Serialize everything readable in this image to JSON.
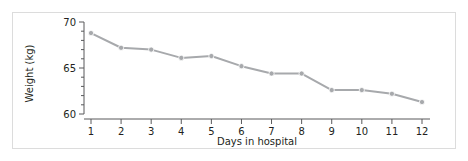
{
  "chart_data": {
    "type": "line",
    "title": "",
    "subtitle": "",
    "xlabel": "Days in hospital",
    "ylabel": "Weight (kg)",
    "categories": [
      1,
      2,
      3,
      4,
      5,
      6,
      7,
      8,
      9,
      10,
      11,
      12
    ],
    "x": [
      1,
      2,
      3,
      4,
      5,
      6,
      7,
      8,
      9,
      10,
      11,
      12
    ],
    "values": [
      68.8,
      67.2,
      67.0,
      66.1,
      66.3,
      65.2,
      64.4,
      64.4,
      62.6,
      62.6,
      62.2,
      61.3
    ],
    "series": [
      {
        "name": "Weight",
        "values": [
          68.8,
          67.2,
          67.0,
          66.1,
          66.3,
          65.2,
          64.4,
          64.4,
          62.6,
          62.6,
          62.2,
          61.3
        ]
      }
    ],
    "xlim": [
      1,
      12
    ],
    "ylim": [
      60,
      70
    ],
    "xticklabels": [
      "1",
      "2",
      "3",
      "4",
      "5",
      "6",
      "7",
      "8",
      "9",
      "10",
      "11",
      "12"
    ],
    "yticklabels": [
      "60",
      "65",
      "70"
    ],
    "yticks": [
      60,
      65,
      70
    ],
    "yminorticks": [
      61,
      62,
      63,
      64,
      66,
      67,
      68,
      69
    ],
    "grid": false,
    "legend": null,
    "legend_position": "none",
    "annotations": [],
    "marker": "circle",
    "line_color": "#a7a9ac",
    "marker_color": "#a7a9ac",
    "axis_color": "#58595b",
    "text_color": "#231f20",
    "frame_color": "#dcdcdc",
    "background": "#ffffff"
  }
}
